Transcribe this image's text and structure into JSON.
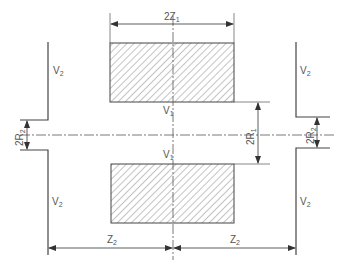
{
  "diagram": {
    "type": "electrode-geometry-cross-section",
    "colors": {
      "line": "#444444",
      "hatch": "#888888",
      "background": "#ffffff"
    },
    "labels": {
      "top_width": {
        "main": "2Z",
        "sub": "1"
      },
      "inner_radius": {
        "main": "2R",
        "sub": "1"
      },
      "outer_radius_left": {
        "main": "2R",
        "sub": "2"
      },
      "outer_radius_right": {
        "main": "2R",
        "sub": "2"
      },
      "gap_left": {
        "main": "Z",
        "sub": "2"
      },
      "gap_right": {
        "main": "Z",
        "sub": "2"
      },
      "v2_top_left": {
        "main": "V",
        "sub": "2"
      },
      "v2_top_right": {
        "main": "V",
        "sub": "2"
      },
      "v2_bottom_left": {
        "main": "V",
        "sub": "2"
      },
      "v2_bottom_right": {
        "main": "V",
        "sub": "2"
      },
      "v1_upper": {
        "main": "V",
        "sub": "1"
      },
      "v1_lower": {
        "main": "V",
        "sub": "1"
      }
    }
  }
}
